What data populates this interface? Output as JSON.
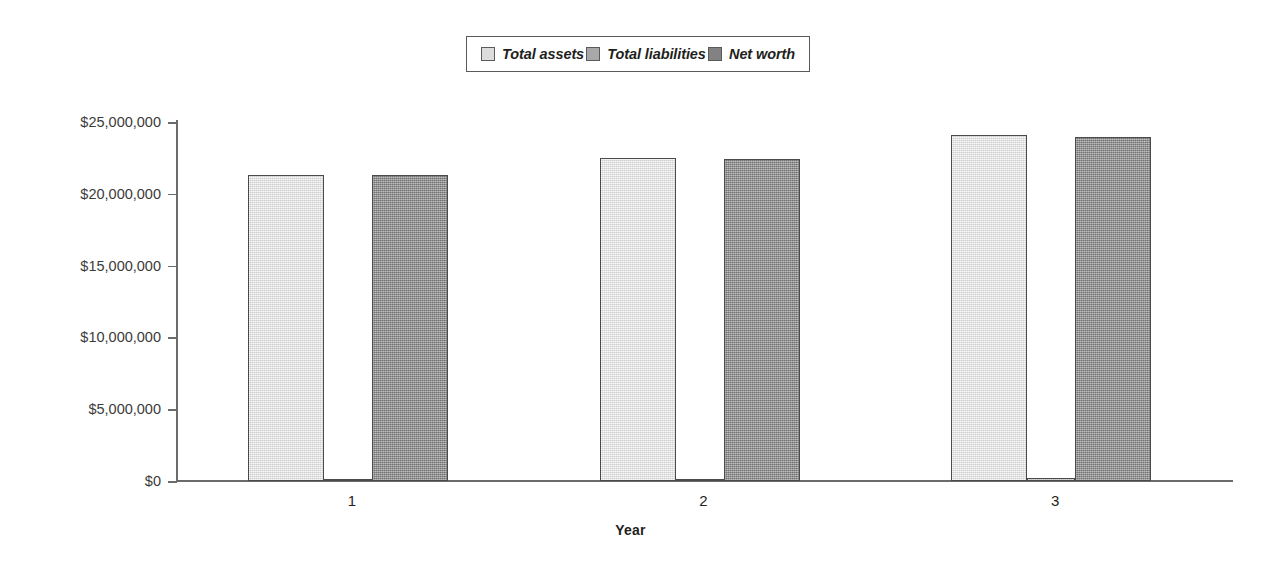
{
  "chart_data": {
    "type": "bar",
    "title": "",
    "subtitle": "",
    "xlabel": "Year",
    "ylabel": "",
    "categories": [
      "1",
      "2",
      "3"
    ],
    "series": [
      {
        "name": "Total assets",
        "color": "#dcdcdc",
        "values": [
          21300000,
          22500000,
          24100000
        ]
      },
      {
        "name": "Total liabilities",
        "color": "#a8a8a8",
        "values": [
          50000,
          150000,
          200000
        ]
      },
      {
        "name": "Net worth",
        "color": "#828282",
        "values": [
          21300000,
          22450000,
          23950000
        ]
      }
    ],
    "ylim": [
      0,
      25000000
    ],
    "yticks": [
      0,
      5000000,
      10000000,
      15000000,
      20000000,
      25000000
    ],
    "ytick_labels": [
      "$0",
      "$5,000,000",
      "$10,000,000",
      "$15,000,000",
      "$20,000,000",
      "$25,000,000"
    ],
    "grid": false,
    "legend_position": "top-center",
    "bar_outline_color": "#4a4a4a",
    "axis_color": "#6b6b6b"
  },
  "legend": {
    "items": [
      {
        "label": "Total assets",
        "swatch": "#dcdcdc"
      },
      {
        "label": "Total liabilities",
        "swatch": "#a8a8a8"
      },
      {
        "label": "Net worth",
        "swatch": "#828282"
      }
    ]
  },
  "axes": {
    "x_title": "Year",
    "x_labels": [
      "1",
      "2",
      "3"
    ],
    "y_labels": [
      "$25,000,000",
      "$20,000,000",
      "$15,000,000",
      "$10,000,000",
      "$5,000,000",
      "$0"
    ]
  }
}
